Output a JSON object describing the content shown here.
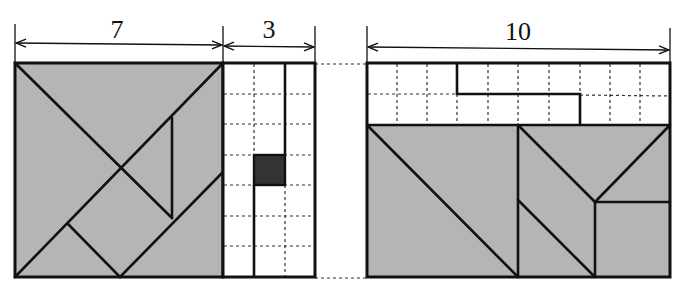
{
  "diagram": {
    "type": "tangram dissection puzzle",
    "colors": {
      "piece_fill": "#b5b5b5",
      "grid_fill": "#ffffff",
      "outline": "#111111",
      "grid_dots": "#333333",
      "filled_cell": "#333333"
    },
    "left_figure": {
      "square": {
        "width_label": "7",
        "width_units": 7,
        "height_units": 7
      },
      "grid_strip": {
        "width_label": "3",
        "width_units": 3,
        "height_units": 7,
        "black_cell": {
          "col": 1,
          "row": 3
        }
      }
    },
    "right_figure": {
      "rectangle": {
        "width_label": "10",
        "width_units": 10,
        "grid_rows": 2,
        "tangram_height_units": 5
      }
    }
  }
}
